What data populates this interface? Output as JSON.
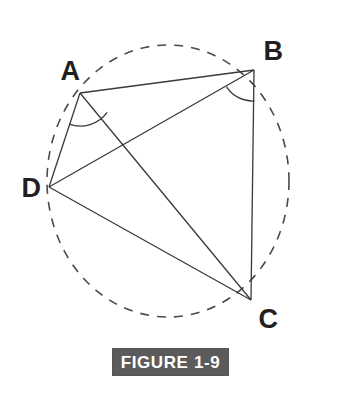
{
  "figure": {
    "caption": "FIGURE 1-9",
    "caption_bg_color": "#5b5b5b",
    "caption_text_color": "#ffffff",
    "background_color": "#ffffff",
    "stroke_color": "#3a3a3a",
    "label_color": "#231f20"
  },
  "circle": {
    "name": "circumscribed-circle",
    "style": "dashed",
    "center_x": 168,
    "center_y": 181,
    "radius_x": 121,
    "radius_y": 136,
    "dash_pattern": "9 8",
    "stroke_width": 1.6
  },
  "vertices": [
    {
      "id": "A",
      "label": "A",
      "x": 80,
      "y": 93,
      "label_x": 70,
      "label_y": 71
    },
    {
      "id": "B",
      "label": "B",
      "x": 254,
      "y": 70,
      "label_x": 273,
      "label_y": 51
    },
    {
      "id": "C",
      "label": "C",
      "x": 251,
      "y": 300,
      "label_x": 268,
      "label_y": 319
    },
    {
      "id": "D",
      "label": "D",
      "x": 49,
      "y": 187,
      "label_x": 31,
      "label_y": 188
    }
  ],
  "segments": [
    {
      "id": "AB",
      "name": "segment-ab",
      "from": "A",
      "to": "B",
      "x1": 80,
      "y1": 93,
      "x2": 254,
      "y2": 70
    },
    {
      "id": "BC",
      "name": "segment-bc",
      "from": "B",
      "to": "C",
      "x1": 254,
      "y1": 70,
      "x2": 251,
      "y2": 300
    },
    {
      "id": "AD",
      "name": "segment-ad",
      "from": "A",
      "to": "D",
      "x1": 80,
      "y1": 93,
      "x2": 49,
      "y2": 187
    },
    {
      "id": "DC",
      "name": "segment-dc",
      "from": "D",
      "to": "C",
      "x1": 49,
      "y1": 187,
      "x2": 251,
      "y2": 300
    },
    {
      "id": "AC",
      "name": "diagonal-ac",
      "from": "A",
      "to": "C",
      "x1": 80,
      "y1": 93,
      "x2": 251,
      "y2": 300
    },
    {
      "id": "BD",
      "name": "diagonal-bd",
      "from": "B",
      "to": "D",
      "x1": 254,
      "y1": 70,
      "x2": 49,
      "y2": 187
    }
  ],
  "angle_arcs": [
    {
      "id": "angle-a",
      "name": "angle-arc-dac",
      "vertex": "A",
      "between": [
        "AD",
        "AC"
      ],
      "radius": 33,
      "path": "M 69.1 124.1 A 33 33 0 0 0 107.1 112.3"
    },
    {
      "id": "angle-b",
      "name": "angle-arc-dbc",
      "vertex": "B",
      "between": [
        "BD",
        "BC"
      ],
      "radius": 31,
      "path": "M 226.6 86.8 A 31 31 0 0 0 254.4 101.0"
    }
  ]
}
